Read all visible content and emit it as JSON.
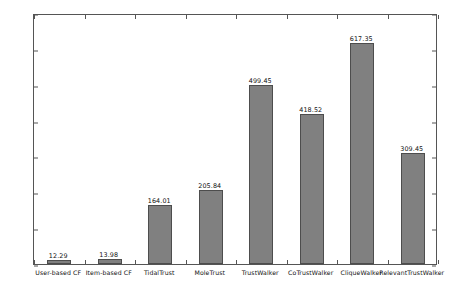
{
  "chart_data": {
    "type": "bar",
    "title": "",
    "xlabel": "",
    "ylabel": "",
    "ylim": [
      0,
      700
    ],
    "yticks": [
      0,
      100,
      200,
      300,
      400,
      500,
      600,
      700
    ],
    "grid": false,
    "legend": "none",
    "bar_color": "#808080",
    "bar_edge_color": "#4d4d4d",
    "categories": [
      "User-based CF",
      "Item-based CF",
      "TidalTrust",
      "MoleTrust",
      "TrustWalker",
      "CoTrustWalker",
      "CliqueWalker",
      "RelevantTrustWalker"
    ],
    "values": [
      12.29,
      13.98,
      164.01,
      205.84,
      499.45,
      418.52,
      617.35,
      309.45
    ],
    "value_labels": [
      "12.29",
      "13.98",
      "164.01",
      "205.84",
      "499.45",
      "418.52",
      "617.35",
      "309.45"
    ]
  }
}
